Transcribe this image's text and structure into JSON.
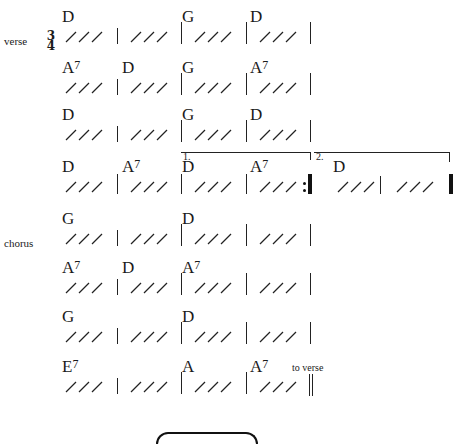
{
  "sections": {
    "verse_label": "verse",
    "chorus_label": "chorus"
  },
  "time_signature": {
    "top": "3",
    "bottom": "4"
  },
  "rows": [
    {
      "section": "verse",
      "measures": [
        {
          "chord": "D",
          "ext": ""
        },
        {
          "chord": "",
          "ext": ""
        },
        {
          "chord": "G",
          "ext": ""
        },
        {
          "chord": "D",
          "ext": ""
        }
      ]
    },
    {
      "measures": [
        {
          "chord": "A",
          "ext": "7"
        },
        {
          "chord": "D",
          "ext": ""
        },
        {
          "chord": "G",
          "ext": ""
        },
        {
          "chord": "A",
          "ext": "7"
        }
      ]
    },
    {
      "measures": [
        {
          "chord": "D",
          "ext": ""
        },
        {
          "chord": "",
          "ext": ""
        },
        {
          "chord": "G",
          "ext": ""
        },
        {
          "chord": "D",
          "ext": ""
        }
      ]
    },
    {
      "measures": [
        {
          "chord": "D",
          "ext": ""
        },
        {
          "chord": "A",
          "ext": "7"
        },
        {
          "chord": "D",
          "ext": ""
        },
        {
          "chord": "A",
          "ext": "7"
        },
        {
          "chord": "D",
          "ext": ""
        },
        {
          "chord": "",
          "ext": ""
        }
      ],
      "endings": [
        {
          "label": "1."
        },
        {
          "label": "2."
        }
      ]
    },
    {
      "section": "chorus",
      "measures": [
        {
          "chord": "G",
          "ext": ""
        },
        {
          "chord": "",
          "ext": ""
        },
        {
          "chord": "D",
          "ext": ""
        },
        {
          "chord": "",
          "ext": ""
        }
      ]
    },
    {
      "measures": [
        {
          "chord": "A",
          "ext": "7"
        },
        {
          "chord": "D",
          "ext": ""
        },
        {
          "chord": "A",
          "ext": "7"
        },
        {
          "chord": "",
          "ext": ""
        }
      ]
    },
    {
      "measures": [
        {
          "chord": "G",
          "ext": ""
        },
        {
          "chord": "",
          "ext": ""
        },
        {
          "chord": "D",
          "ext": ""
        },
        {
          "chord": "",
          "ext": ""
        }
      ]
    },
    {
      "measures": [
        {
          "chord": "E",
          "ext": "7"
        },
        {
          "chord": "",
          "ext": ""
        },
        {
          "chord": "A",
          "ext": ""
        },
        {
          "chord": "A",
          "ext": "7"
        }
      ],
      "note": "to verse"
    }
  ],
  "slash_glyph": "///"
}
